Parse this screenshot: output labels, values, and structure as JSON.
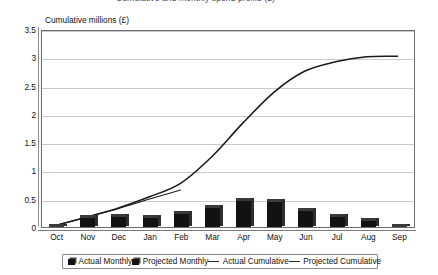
{
  "chart_title_cropped": "Cumulative and monthly spend profile (£)",
  "axis": {
    "y_title": "Cumulative millions (£)",
    "y_ticks": [
      "3.5",
      "3",
      "2.5",
      "2",
      "1.5",
      "1",
      "0.5",
      "0"
    ],
    "x_ticks": [
      "Oct",
      "Nov",
      "Dec",
      "Jan",
      "Feb",
      "Mar",
      "Apr",
      "May",
      "Jun",
      "Jul",
      "Aug",
      "Sep"
    ]
  },
  "legend": {
    "items": [
      {
        "label": "Actual Monthly",
        "marker": "bar-swatch-icon"
      },
      {
        "label": "Projected Monthly",
        "marker": "bar-swatch-icon"
      },
      {
        "label": "Actual Cumulative",
        "marker": "line-swatch-icon"
      },
      {
        "label": "Projected Cumulative",
        "marker": "line-swatch-icon"
      }
    ]
  },
  "chart_data": {
    "type": "bar",
    "title": "Cumulative and monthly spend profile (£)",
    "xlabel": "",
    "ylabel": "Cumulative millions (£)",
    "ylim": [
      0,
      3.5
    ],
    "ytick_values": [
      0,
      0.5,
      1,
      1.5,
      2,
      2.5,
      3,
      3.5
    ],
    "grid": true,
    "legend_position": "bottom",
    "categories": [
      "Oct",
      "Nov",
      "Dec",
      "Jan",
      "Feb",
      "Mar",
      "Apr",
      "May",
      "Jun",
      "Jul",
      "Aug",
      "Sep"
    ],
    "series": [
      {
        "name": "Actual Monthly",
        "type": "bar",
        "values": [
          0.03,
          0.2,
          0.21,
          0.2,
          0.26,
          null,
          null,
          null,
          null,
          null,
          null,
          null
        ]
      },
      {
        "name": "Projected Monthly",
        "type": "bar",
        "values": [
          null,
          null,
          null,
          null,
          null,
          0.38,
          0.5,
          0.47,
          0.32,
          0.22,
          0.14,
          0.03
        ]
      },
      {
        "name": "Actual Cumulative",
        "type": "line",
        "values": [
          0.03,
          0.18,
          0.33,
          0.5,
          0.66,
          null,
          null,
          null,
          null,
          null,
          null,
          null
        ]
      },
      {
        "name": "Projected Cumulative",
        "type": "line",
        "values": [
          0.03,
          0.18,
          0.34,
          0.54,
          0.78,
          1.25,
          1.85,
          2.4,
          2.78,
          2.95,
          3.04,
          3.05
        ]
      }
    ]
  }
}
